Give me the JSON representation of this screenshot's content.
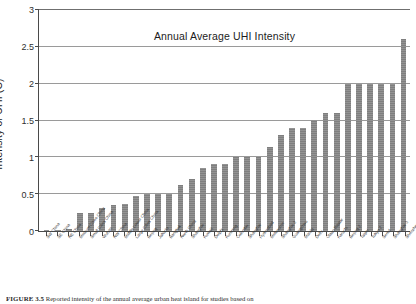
{
  "figure": {
    "caption_label": "FIGURE 3.5",
    "caption_text": "Reported intensity of the annual average urban heat island for studies based on"
  },
  "chart_data": {
    "type": "bar",
    "title": "Annual Average UHI Intensity",
    "xlabel": "",
    "ylabel": "Intensity of UHI (C)",
    "ylim": [
      0,
      3
    ],
    "ytick_labels": [
      "0",
      "0.5",
      "1",
      "1.5",
      "2",
      "2.5",
      "3"
    ],
    "ytick_values": [
      0,
      0.5,
      1,
      1.5,
      2,
      2.5,
      3
    ],
    "grid": true,
    "legend": false,
    "bar_color": "#7f7f7f",
    "categories": [
      "SW China",
      "SE China",
      "NE China",
      "Medium Cities China",
      "Small Cities China",
      "Wuhan",
      "NW China",
      "Middle Lower China",
      "Large Cities China",
      "Beijing",
      "Jakarta",
      "Bangkok",
      "North China",
      "Shanghai",
      "Kuwait",
      "Delphi",
      "Kunming",
      "Colombo",
      "Shanghai",
      "Hyderabad",
      "Melbourne",
      "Shanghai 2",
      "Guangzhou",
      "Manila",
      "Delhi",
      "Ulaan Baatar",
      "Karachi",
      "Beijing 2",
      "Taipei",
      "Tokyo 2",
      "Seoul",
      "Shanghai 3",
      "Shenzhen"
    ],
    "values": [
      0.01,
      0.01,
      0.03,
      0.25,
      0.25,
      0.31,
      0.35,
      0.36,
      0.48,
      0.5,
      0.5,
      0.5,
      0.63,
      0.7,
      0.85,
      0.91,
      0.91,
      1.0,
      1.0,
      1.0,
      1.14,
      1.3,
      1.4,
      1.4,
      1.51,
      1.6,
      1.6,
      2.0,
      2.0,
      2.0,
      2.0,
      2.0,
      2.61
    ]
  }
}
